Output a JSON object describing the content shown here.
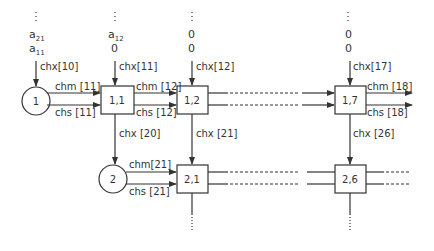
{
  "diagram": {
    "type": "systolic-array-channel-diagram",
    "colors": {
      "stroke": "#333333",
      "text": "#333333",
      "background": "#ffffff"
    },
    "top_inputs": [
      {
        "col": 1,
        "line1": "a",
        "line1_sub": "21",
        "line2": "a",
        "line2_sub": "11"
      },
      {
        "col": 2,
        "line1": "a",
        "line1_sub": "12",
        "line2": "0",
        "line2_sub": ""
      },
      {
        "col": 3,
        "line1": "0",
        "line1_sub": "",
        "line2": "0",
        "line2_sub": ""
      },
      {
        "col": 4,
        "line1": "0",
        "line1_sub": "",
        "line2": "0",
        "line2_sub": ""
      }
    ],
    "sources": [
      {
        "id": "src-1",
        "label": "1"
      },
      {
        "id": "src-2",
        "label": "2"
      }
    ],
    "cells": [
      {
        "id": "cell-1-1",
        "label": "1,1"
      },
      {
        "id": "cell-1-2",
        "label": "1,2"
      },
      {
        "id": "cell-1-7",
        "label": "1,7"
      },
      {
        "id": "cell-2-1",
        "label": "2,1"
      },
      {
        "id": "cell-2-6",
        "label": "2,6"
      }
    ],
    "channels": {
      "chx10": "chx[10]",
      "chx11": "chx[11]",
      "chx12": "chx[12]",
      "chx17": "chx[17]",
      "chx20": "chx [20]",
      "chx21": "chx [21]",
      "chx26": "chx [26]",
      "chm11": "chm [11]",
      "chs11": "chs [11]",
      "chm12": "chm [12]",
      "chs12": "chs [12]",
      "chm18": "chm [18]",
      "chs18": "chs [18]",
      "chm21": "chm[21]",
      "chs21": "chs [21]"
    }
  }
}
